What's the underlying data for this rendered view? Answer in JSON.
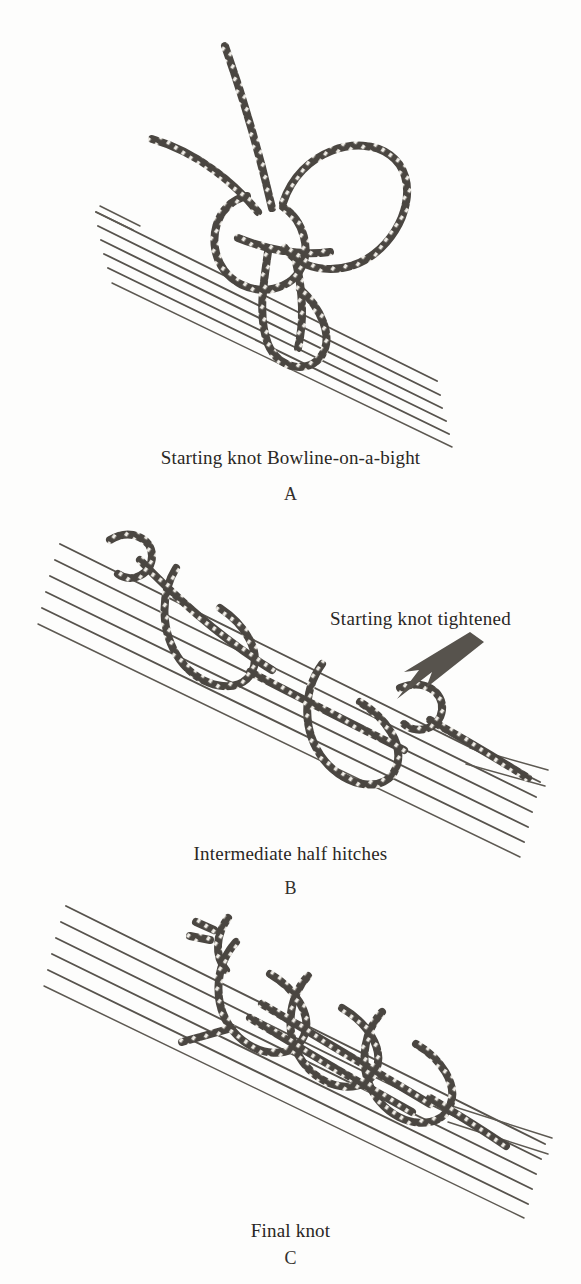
{
  "figure": {
    "background_color": "#fdfdfc",
    "ink_color": "#4a4641",
    "panels": [
      {
        "id": "A",
        "letter": "A",
        "caption": "Starting knot Bowline-on-a-bight",
        "annotations": []
      },
      {
        "id": "B",
        "letter": "B",
        "caption": "Intermediate half hitches",
        "annotations": [
          {
            "text": "Starting knot tightened",
            "pointer": "arrow-down-left"
          }
        ]
      },
      {
        "id": "C",
        "letter": "C",
        "caption": "Final knot",
        "annotations": []
      }
    ]
  },
  "icons": {
    "arrow": "arrow-icon",
    "rope": "rope-icon",
    "bundle": "wire-bundle-icon"
  }
}
